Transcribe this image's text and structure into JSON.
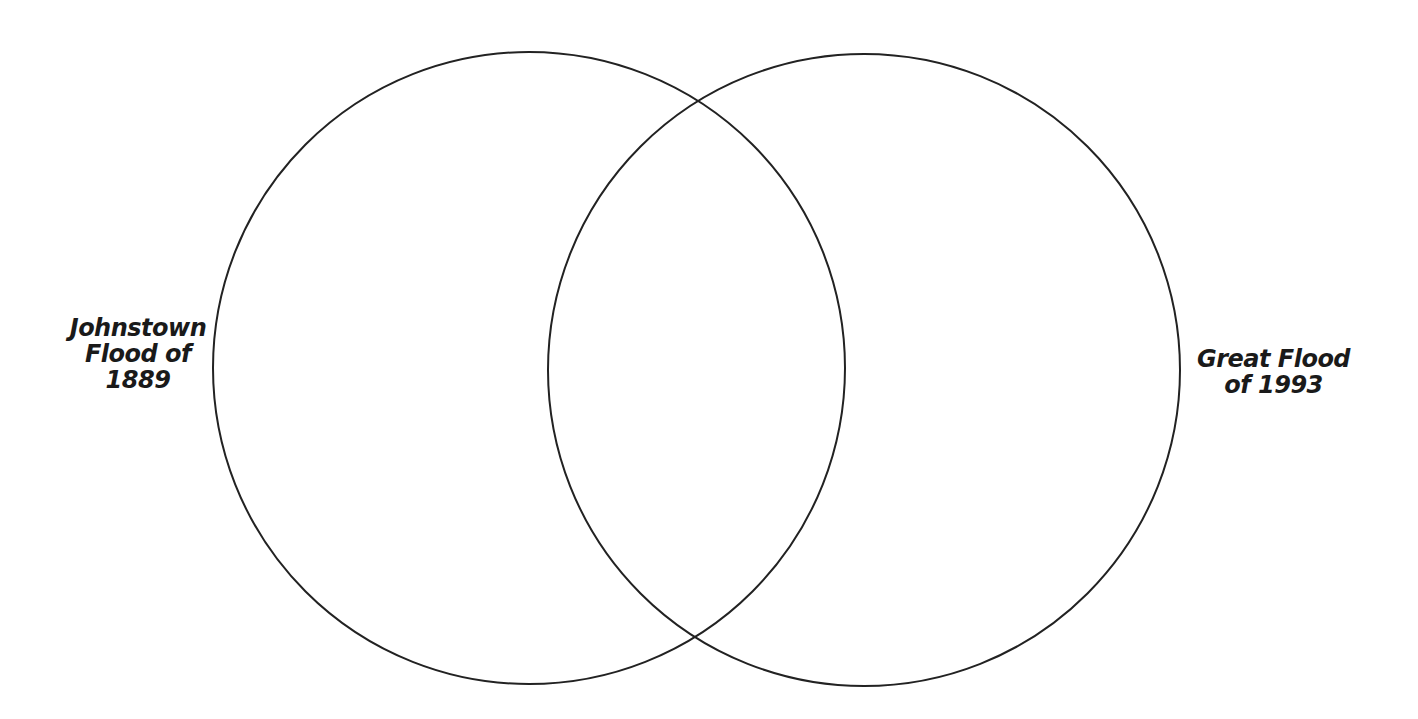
{
  "diagram": {
    "type": "venn",
    "sets": [
      {
        "label_lines": [
          "Johnstown",
          "Flood of",
          "1889"
        ]
      },
      {
        "label_lines": [
          "Great Flood",
          "of 1993"
        ]
      }
    ],
    "stroke_color": "#222222",
    "background": "#ffffff"
  }
}
